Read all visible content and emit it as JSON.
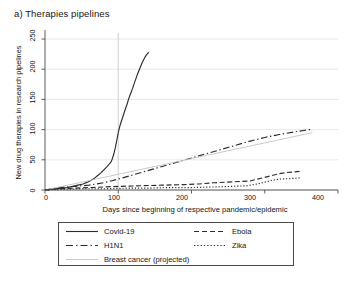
{
  "figure": {
    "panel_label": "a) Therapies pipelines"
  },
  "chart_data": {
    "type": "line",
    "title": "a) Therapies pipelines",
    "xlabel": "Days since beginning of respective pandemic/epidemic",
    "ylabel": "New drug therapies in research pipelines",
    "xlim": [
      0,
      400
    ],
    "ylim": [
      0,
      260
    ],
    "xticks": [
      0,
      100,
      200,
      300,
      400
    ],
    "yticks": [
      0,
      50,
      100,
      150,
      200,
      250
    ],
    "grid": "horizontal-gridlines-plus-vertical-reference-at-100",
    "legend_position": "below-axes",
    "reference_line_x": 100,
    "series": [
      {
        "name": "Covid-19",
        "style": "solid",
        "color": "#2b2b2b",
        "points": [
          [
            0,
            0
          ],
          [
            8,
            1
          ],
          [
            15,
            2
          ],
          [
            22,
            3
          ],
          [
            30,
            4
          ],
          [
            38,
            6
          ],
          [
            45,
            8
          ],
          [
            52,
            10
          ],
          [
            58,
            13
          ],
          [
            63,
            16
          ],
          [
            68,
            20
          ],
          [
            72,
            24
          ],
          [
            76,
            28
          ],
          [
            80,
            33
          ],
          [
            84,
            38
          ],
          [
            87,
            42
          ],
          [
            90,
            46
          ],
          [
            92,
            52
          ],
          [
            94,
            60
          ],
          [
            96,
            70
          ],
          [
            98,
            82
          ],
          [
            100,
            95
          ],
          [
            102,
            105
          ],
          [
            104,
            113
          ],
          [
            106,
            120
          ],
          [
            108,
            128
          ],
          [
            110,
            135
          ],
          [
            112,
            142
          ],
          [
            114,
            150
          ],
          [
            116,
            157
          ],
          [
            118,
            163
          ],
          [
            120,
            170
          ],
          [
            122,
            177
          ],
          [
            124,
            184
          ],
          [
            126,
            191
          ],
          [
            128,
            197
          ],
          [
            130,
            203
          ],
          [
            132,
            209
          ],
          [
            134,
            214
          ],
          [
            136,
            219
          ],
          [
            138,
            223
          ],
          [
            140,
            226
          ],
          [
            142,
            228
          ]
        ]
      },
      {
        "name": "H1N1",
        "style": "dash-dot",
        "color": "#2b2b2b",
        "points": [
          [
            0,
            0
          ],
          [
            10,
            2
          ],
          [
            20,
            4
          ],
          [
            30,
            5
          ],
          [
            40,
            6
          ],
          [
            50,
            7
          ],
          [
            60,
            8
          ],
          [
            70,
            10
          ],
          [
            80,
            12
          ],
          [
            90,
            15
          ],
          [
            100,
            18
          ],
          [
            120,
            25
          ],
          [
            140,
            32
          ],
          [
            160,
            39
          ],
          [
            180,
            46
          ],
          [
            200,
            53
          ],
          [
            220,
            60
          ],
          [
            240,
            67
          ],
          [
            260,
            74
          ],
          [
            280,
            81
          ],
          [
            300,
            87
          ],
          [
            320,
            92
          ],
          [
            340,
            96
          ],
          [
            355,
            99
          ],
          [
            362,
            100
          ]
        ]
      },
      {
        "name": "Breast cancer (projected)",
        "style": "thin-solid-light",
        "color": "#c4c4c4",
        "points": [
          [
            0,
            0
          ],
          [
            100,
            26
          ],
          [
            200,
            52
          ],
          [
            300,
            78
          ],
          [
            365,
            95
          ]
        ]
      },
      {
        "name": "Ebola",
        "style": "dashed",
        "color": "#2b2b2b",
        "points": [
          [
            0,
            0
          ],
          [
            20,
            2
          ],
          [
            40,
            3
          ],
          [
            60,
            4
          ],
          [
            80,
            5
          ],
          [
            100,
            6
          ],
          [
            130,
            7
          ],
          [
            160,
            8
          ],
          [
            190,
            9
          ],
          [
            210,
            10
          ],
          [
            230,
            12
          ],
          [
            250,
            13
          ],
          [
            265,
            14
          ],
          [
            280,
            15
          ],
          [
            290,
            18
          ],
          [
            300,
            21
          ],
          [
            310,
            24
          ],
          [
            320,
            27
          ],
          [
            330,
            29
          ],
          [
            340,
            30
          ],
          [
            350,
            31
          ]
        ]
      },
      {
        "name": "Zika",
        "style": "dotted",
        "color": "#2b2b2b",
        "points": [
          [
            0,
            0
          ],
          [
            25,
            1
          ],
          [
            50,
            2
          ],
          [
            80,
            2
          ],
          [
            110,
            3
          ],
          [
            140,
            3
          ],
          [
            170,
            4
          ],
          [
            200,
            4
          ],
          [
            230,
            5
          ],
          [
            255,
            6
          ],
          [
            275,
            7
          ],
          [
            290,
            10
          ],
          [
            300,
            13
          ],
          [
            310,
            16
          ],
          [
            320,
            18
          ],
          [
            335,
            19
          ],
          [
            348,
            20
          ]
        ]
      }
    ]
  },
  "axes": {
    "y_title": "New drug therapies in research pipelines",
    "y_ticks": [
      "0",
      "50",
      "100",
      "150",
      "200",
      "250"
    ],
    "x_title": "Days since beginning of respective pandemic/epidemic",
    "x_ticks": [
      "0",
      "100",
      "200",
      "300",
      "400"
    ]
  },
  "legend": {
    "entries": [
      {
        "label": "Covid-19",
        "style": "solid"
      },
      {
        "label": "Ebola",
        "style": "dashed"
      },
      {
        "label": "H1N1",
        "style": "dash-dot"
      },
      {
        "label": "Zika",
        "style": "dotted"
      },
      {
        "label": "Breast cancer (projected)",
        "style": "thin-solid-light"
      }
    ]
  },
  "colors": {
    "line": "#2b2b2b",
    "projected": "#c4c4c4",
    "grid": "#e2e2e2",
    "axis": "#4a4a4a",
    "text": "#141414"
  }
}
